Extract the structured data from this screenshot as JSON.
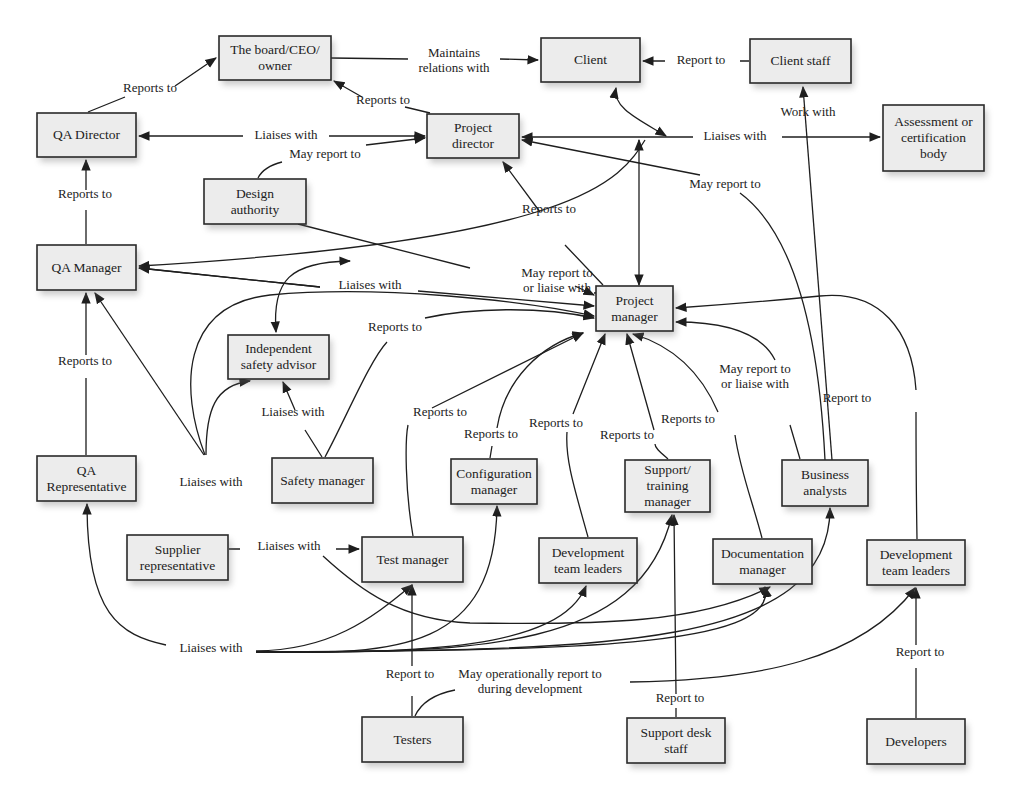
{
  "diagram": {
    "type": "organization-chart",
    "nodes": [
      {
        "id": "board",
        "lines": [
          "The board/CEO/",
          "owner"
        ],
        "x": 219,
        "y": 36,
        "w": 112,
        "h": 44
      },
      {
        "id": "client",
        "lines": [
          "Client"
        ],
        "x": 541,
        "y": 38,
        "w": 99,
        "h": 44
      },
      {
        "id": "client_staff",
        "lines": [
          "Client staff"
        ],
        "x": 750,
        "y": 39,
        "w": 101,
        "h": 44
      },
      {
        "id": "qa_director",
        "lines": [
          "QA Director"
        ],
        "x": 37,
        "y": 113,
        "w": 99,
        "h": 44
      },
      {
        "id": "project_director",
        "lines": [
          "Project",
          "director"
        ],
        "x": 427,
        "y": 114,
        "w": 92,
        "h": 44
      },
      {
        "id": "assessment_body",
        "lines": [
          "Assessment or",
          "certification",
          "body"
        ],
        "x": 883,
        "y": 105,
        "w": 101,
        "h": 66
      },
      {
        "id": "design_authority",
        "lines": [
          "Design",
          "authority"
        ],
        "x": 204,
        "y": 179,
        "w": 102,
        "h": 45
      },
      {
        "id": "qa_manager",
        "lines": [
          "QA Manager"
        ],
        "x": 37,
        "y": 245,
        "w": 99,
        "h": 45
      },
      {
        "id": "project_manager",
        "lines": [
          "Project",
          "manager"
        ],
        "x": 596,
        "y": 286,
        "w": 77,
        "h": 45
      },
      {
        "id": "independent_safety_advisor",
        "lines": [
          "Independent",
          "safety advisor"
        ],
        "x": 228,
        "y": 335,
        "w": 101,
        "h": 44
      },
      {
        "id": "qa_representative",
        "lines": [
          "QA",
          "Representative"
        ],
        "x": 37,
        "y": 456,
        "w": 99,
        "h": 45
      },
      {
        "id": "safety_manager",
        "lines": [
          "Safety manager"
        ],
        "x": 272,
        "y": 458,
        "w": 101,
        "h": 45
      },
      {
        "id": "configuration_manager",
        "lines": [
          "Configuration",
          "manager"
        ],
        "x": 451,
        "y": 459,
        "w": 86,
        "h": 45
      },
      {
        "id": "support_training_manager",
        "lines": [
          "Support/",
          "training",
          "manager"
        ],
        "x": 625,
        "y": 460,
        "w": 85,
        "h": 52
      },
      {
        "id": "business_analysts",
        "lines": [
          "Business",
          "analysts"
        ],
        "x": 782,
        "y": 460,
        "w": 86,
        "h": 46
      },
      {
        "id": "supplier_representative",
        "lines": [
          "Supplier",
          "representative"
        ],
        "x": 127,
        "y": 535,
        "w": 101,
        "h": 45
      },
      {
        "id": "test_manager",
        "lines": [
          "Test manager"
        ],
        "x": 362,
        "y": 537,
        "w": 101,
        "h": 45
      },
      {
        "id": "dev_team_leaders_1",
        "lines": [
          "Development",
          "team leaders"
        ],
        "x": 539,
        "y": 538,
        "w": 98,
        "h": 45
      },
      {
        "id": "documentation_manager",
        "lines": [
          "Documentation",
          "manager"
        ],
        "x": 713,
        "y": 539,
        "w": 99,
        "h": 45
      },
      {
        "id": "dev_team_leaders_2",
        "lines": [
          "Development",
          "team leaders"
        ],
        "x": 867,
        "y": 540,
        "w": 98,
        "h": 45
      },
      {
        "id": "testers",
        "lines": [
          "Testers"
        ],
        "x": 362,
        "y": 717,
        "w": 101,
        "h": 45
      },
      {
        "id": "support_desk_staff",
        "lines": [
          "Support desk",
          "staff"
        ],
        "x": 627,
        "y": 718,
        "w": 98,
        "h": 45
      },
      {
        "id": "developers",
        "lines": [
          "Developers"
        ],
        "x": 867,
        "y": 719,
        "w": 98,
        "h": 45
      }
    ],
    "edge_labels": [
      {
        "id": "lbl_qad_board",
        "lines": [
          "Reports to"
        ],
        "x": 150,
        "y": 92
      },
      {
        "id": "lbl_board_client",
        "lines": [
          "Maintains",
          "relations with"
        ],
        "x": 454,
        "y": 57
      },
      {
        "id": "lbl_pd_board",
        "lines": [
          "Reports to"
        ],
        "x": 383,
        "y": 104
      },
      {
        "id": "lbl_staff_client",
        "lines": [
          "Report to"
        ],
        "x": 701,
        "y": 64
      },
      {
        "id": "lbl_ba_staff",
        "lines": [
          "Work with"
        ],
        "x": 808,
        "y": 116
      },
      {
        "id": "lbl_qad_pd",
        "lines": [
          "Liaises with"
        ],
        "x": 286,
        "y": 139
      },
      {
        "id": "lbl_da_pd",
        "lines": [
          "May report to"
        ],
        "x": 325,
        "y": 158
      },
      {
        "id": "lbl_pd_assess",
        "lines": [
          "Liaises with"
        ],
        "x": 735,
        "y": 140
      },
      {
        "id": "lbl_ba_pd",
        "lines": [
          "May report to"
        ],
        "x": 725,
        "y": 188
      },
      {
        "id": "lbl_qam_qad",
        "lines": [
          "Reports to"
        ],
        "x": 85,
        "y": 198
      },
      {
        "id": "lbl_pm_pd",
        "lines": [
          "Reports to"
        ],
        "x": 549,
        "y": 213
      },
      {
        "id": "lbl_da_pm",
        "lines": [
          "May report to",
          "or liaise with"
        ],
        "x": 557,
        "y": 277
      },
      {
        "id": "lbl_qam_pm",
        "lines": [
          "Liaises with"
        ],
        "x": 370,
        "y": 289
      },
      {
        "id": "lbl_sm_pm",
        "lines": [
          "Reports to"
        ],
        "x": 395,
        "y": 331
      },
      {
        "id": "lbl_qar_qam",
        "lines": [
          "Reports to"
        ],
        "x": 85,
        "y": 365
      },
      {
        "id": "lbl_sm_isa",
        "lines": [
          "Liaises with"
        ],
        "x": 293,
        "y": 416
      },
      {
        "id": "lbl_tm_pm",
        "lines": [
          "Reports to"
        ],
        "x": 440,
        "y": 416
      },
      {
        "id": "lbl_cm_pm",
        "lines": [
          "Reports to"
        ],
        "x": 491,
        "y": 438
      },
      {
        "id": "lbl_dtl_pm",
        "lines": [
          "Reports to"
        ],
        "x": 556,
        "y": 427
      },
      {
        "id": "lbl_stm_pm",
        "lines": [
          "Reports to"
        ],
        "x": 627,
        "y": 439
      },
      {
        "id": "lbl_doc_pm",
        "lines": [
          "Reports to"
        ],
        "x": 688,
        "y": 423
      },
      {
        "id": "lbl_ba_pm",
        "lines": [
          "May report to",
          "or liaise with"
        ],
        "x": 755,
        "y": 373
      },
      {
        "id": "lbl_dtl2_pm",
        "lines": [
          "Report to"
        ],
        "x": 847,
        "y": 402
      },
      {
        "id": "lbl_sup_liaise",
        "lines": [
          "Liaises with"
        ],
        "x": 211,
        "y": 486
      },
      {
        "id": "lbl_sup_tm",
        "lines": [
          "Liaises with"
        ],
        "x": 289,
        "y": 550
      },
      {
        "id": "lbl_liaises_bottom",
        "lines": [
          "Liaises with"
        ],
        "x": 211,
        "y": 652
      },
      {
        "id": "lbl_testers_tm",
        "lines": [
          "Report to"
        ],
        "x": 410,
        "y": 678
      },
      {
        "id": "lbl_testers_dtl2",
        "lines": [
          "May operationally report to",
          "during development"
        ],
        "x": 530,
        "y": 678
      },
      {
        "id": "lbl_sds_stm",
        "lines": [
          "Report to"
        ],
        "x": 680,
        "y": 702
      },
      {
        "id": "lbl_dev_dtl2",
        "lines": [
          "Report to"
        ],
        "x": 920,
        "y": 656
      }
    ]
  }
}
